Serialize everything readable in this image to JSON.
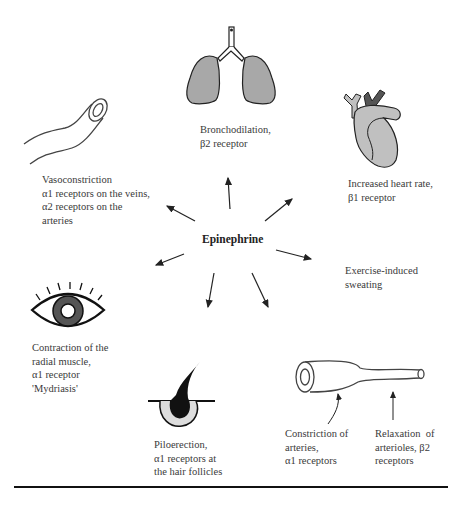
{
  "center": {
    "label": "Epinephrine"
  },
  "effects": [
    {
      "id": "bronchodilation",
      "lines": [
        "Bronchodilation,",
        "β2 receptor"
      ]
    },
    {
      "id": "heart",
      "lines": [
        "Increased heart rate,",
        "β1 receptor"
      ]
    },
    {
      "id": "vasoconstriction",
      "lines": [
        "Vasoconstriction",
        "α1 receptors on the veins,",
        "α2 receptors on the",
        "arteries"
      ]
    },
    {
      "id": "sweating",
      "lines": [
        "Exercise-induced",
        "sweating"
      ]
    },
    {
      "id": "mydriasis",
      "lines": [
        "Contraction of the",
        "radial muscle,",
        "α1 receptor",
        "'Mydriasis'"
      ]
    },
    {
      "id": "piloerection",
      "lines": [
        "Piloerection,",
        "α1 receptors at",
        "the hair follicles"
      ]
    },
    {
      "id": "artery-constriction",
      "lines": [
        "Constriction of",
        "arteries,",
        "α1 receptors"
      ]
    },
    {
      "id": "arteriole-relaxation",
      "lines": [
        "Relaxation  of",
        "arterioles, β2",
        "receptors"
      ]
    }
  ],
  "colors": {
    "organ_fill": "#a8a8a8",
    "heart_fill": "#c0c0c0",
    "heart_dark": "#555555",
    "line": "#222222"
  }
}
